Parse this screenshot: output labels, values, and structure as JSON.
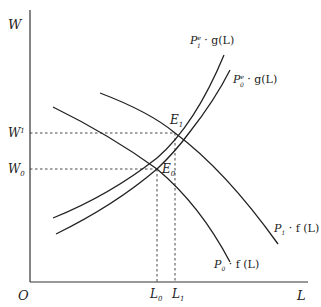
{
  "axes": {
    "y_label": "W",
    "x_label": "L",
    "origin_label": "O"
  },
  "levels": {
    "w1": {
      "base": "W",
      "sup": "1"
    },
    "w0": {
      "base": "W",
      "sub": "0"
    },
    "l0": {
      "base": "L",
      "sub": "0"
    },
    "l1": {
      "base": "L",
      "sub": "1"
    }
  },
  "points": {
    "e1": {
      "base": "E",
      "sub": "1"
    },
    "e0": {
      "base": "E",
      "sub": "0"
    }
  },
  "curves": {
    "p1e_g": {
      "p": "P",
      "sup": "e",
      "sub": "1",
      "rest": " · g(L)"
    },
    "p0e_g": {
      "p": "P",
      "sup": "e",
      "sub": "0",
      "rest": " · g(L)"
    },
    "p1_f": {
      "p": "P",
      "sub": "1",
      "rest": " · f (L)"
    },
    "p0_f": {
      "p": "P",
      "sub": "0",
      "rest": " · f (L)"
    }
  },
  "colors": {
    "line": "#222222",
    "background": "#ffffff"
  }
}
